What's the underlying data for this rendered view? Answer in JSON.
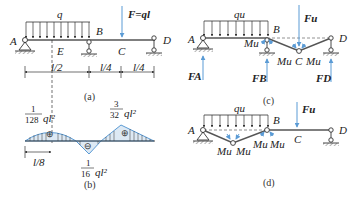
{
  "colors": {
    "beam": "#555555",
    "blue": "#5b9bd5",
    "fill": "#d7e8f5",
    "text": "#222222"
  },
  "fig_a": {
    "caption": "(a)",
    "load_label": "q",
    "force_label": "F=ql",
    "points": {
      "A": "A",
      "B": "B",
      "C": "C",
      "D": "D",
      "E": "E"
    },
    "dims": [
      "l/2",
      "l/4",
      "l/4"
    ]
  },
  "fig_b": {
    "caption": "(b)",
    "max_pos_left": {
      "num": "1",
      "den": "128",
      "tail": "ql²"
    },
    "max_neg": {
      "num": "1",
      "den": "16",
      "tail": "ql²"
    },
    "max_pos_right": {
      "num": "3",
      "den": "32",
      "tail": "ql²"
    },
    "offset_label": "l/8",
    "signs": [
      "⊕",
      "⊖",
      "⊕"
    ]
  },
  "fig_c": {
    "caption": "(c)",
    "load_label": "qu",
    "force_label": "Fu",
    "points": {
      "A": "A",
      "B": "B",
      "C": "C",
      "D": "D"
    },
    "moments": [
      "Mu",
      "Mu",
      "Mu"
    ],
    "reactions": [
      "FA",
      "FB",
      "FD"
    ]
  },
  "fig_d": {
    "caption": "(d)",
    "load_label": "qu",
    "force_label": "Fu",
    "points": {
      "A": "A",
      "B": "B",
      "C": "C",
      "D": "D"
    },
    "moments": [
      "Mu",
      "Mu",
      "Mu",
      "Mu"
    ]
  }
}
